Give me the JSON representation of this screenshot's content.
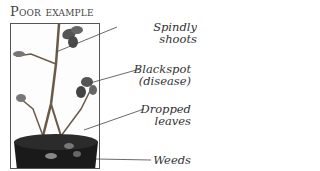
{
  "title": "Poor example",
  "labels": [
    {
      "id": "spindly",
      "lines": [
        "Spindly shoots"
      ]
    },
    {
      "id": "blackspot",
      "lines": [
        "Blackspot",
        "(disease)"
      ]
    },
    {
      "id": "dropped",
      "lines": [
        "Dropped",
        "leaves"
      ]
    },
    {
      "id": "weeds",
      "lines": [
        "Weeds"
      ]
    }
  ],
  "colors": {
    "frame": "#555555",
    "text": "#333333",
    "pot": "#1a1a1a",
    "leaf": "#5a5a5a"
  }
}
